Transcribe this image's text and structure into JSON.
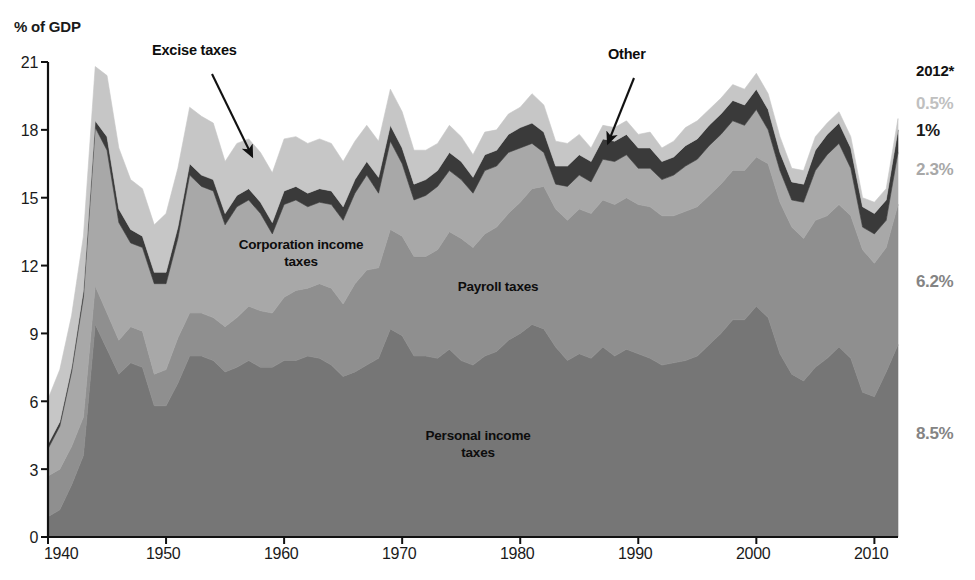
{
  "axes": {
    "y_title": "% of GDP",
    "y_ticks": [
      "21",
      "18",
      "15",
      "12",
      "9",
      "6",
      "3",
      "0"
    ],
    "y_values": [
      21,
      18,
      15,
      12,
      9,
      6,
      3,
      0
    ],
    "x_ticks": [
      "1940",
      "1950",
      "1960",
      "1970",
      "1980",
      "1990",
      "2000",
      "2010"
    ],
    "x_values": [
      1940,
      1950,
      1960,
      1970,
      1980,
      1990,
      2000,
      2010
    ]
  },
  "series_labels": {
    "personal": "Personal income\ntaxes",
    "payroll": "Payroll taxes",
    "corporate": "Corporation income\ntaxes",
    "excise": "Excise taxes",
    "other": "Other"
  },
  "end_labels": {
    "year": "2012*",
    "excise": "0.5%",
    "other": "1%",
    "corporate": "2.3%",
    "payroll": "6.2%",
    "personal": "8.5%"
  },
  "colors": {
    "personal": "#767676",
    "payroll": "#8f8f8f",
    "corporate": "#a8a8a8",
    "other": "#3a3a3a",
    "excise": "#c6c6c6",
    "axis": "#111111",
    "text": "#111111",
    "label_excise": "#c0c0c0",
    "label_other": "#1a1a1a",
    "label_corporate": "#a8a8a8",
    "label_payroll": "#808080",
    "label_personal": "#808080"
  },
  "chart_data": {
    "type": "area",
    "title": "",
    "subtitle": "",
    "xlabel": "",
    "ylabel": "% of GDP",
    "xlim": [
      1940,
      2012
    ],
    "ylim": [
      0,
      21
    ],
    "grid": false,
    "stacked": true,
    "legend": "in-plot annotations",
    "annotations": [
      {
        "text": "Excise taxes",
        "points_to_series": "excise",
        "arrow_from": [
          154,
          62
        ],
        "arrow_to": [
          250,
          158
        ]
      },
      {
        "text": "Other",
        "points_to_series": "other",
        "arrow_from": [
          648,
          68
        ],
        "arrow_to": [
          604,
          140
        ]
      }
    ],
    "x": [
      1940,
      1941,
      1942,
      1943,
      1944,
      1945,
      1946,
      1947,
      1948,
      1949,
      1950,
      1951,
      1952,
      1953,
      1954,
      1955,
      1956,
      1957,
      1958,
      1959,
      1960,
      1961,
      1962,
      1963,
      1964,
      1965,
      1966,
      1967,
      1968,
      1969,
      1970,
      1971,
      1972,
      1973,
      1974,
      1975,
      1976,
      1977,
      1978,
      1979,
      1980,
      1981,
      1982,
      1983,
      1984,
      1985,
      1986,
      1987,
      1988,
      1989,
      1990,
      1991,
      1992,
      1993,
      1994,
      1995,
      1996,
      1997,
      1998,
      1999,
      2000,
      2001,
      2002,
      2003,
      2004,
      2005,
      2006,
      2007,
      2008,
      2009,
      2010,
      2011,
      2012
    ],
    "series": [
      {
        "name": "Personal income taxes",
        "color": "#767676",
        "values": [
          0.9,
          1.2,
          2.3,
          3.6,
          9.4,
          8.3,
          7.2,
          7.7,
          7.5,
          5.8,
          5.8,
          6.8,
          8.0,
          8.0,
          7.8,
          7.3,
          7.5,
          7.8,
          7.5,
          7.5,
          7.8,
          7.8,
          8.0,
          7.9,
          7.6,
          7.1,
          7.3,
          7.6,
          7.9,
          9.2,
          8.9,
          8.0,
          8.0,
          7.9,
          8.3,
          7.8,
          7.6,
          8.0,
          8.2,
          8.7,
          9.0,
          9.4,
          9.2,
          8.4,
          7.8,
          8.1,
          7.9,
          8.4,
          8.0,
          8.3,
          8.1,
          7.9,
          7.6,
          7.7,
          7.8,
          8.0,
          8.5,
          9.0,
          9.6,
          9.6,
          10.2,
          9.7,
          8.1,
          7.2,
          6.9,
          7.5,
          7.9,
          8.4,
          7.9,
          6.4,
          6.2,
          7.3,
          8.5
        ]
      },
      {
        "name": "Payroll taxes",
        "color": "#8f8f8f",
        "values": [
          1.8,
          1.8,
          1.7,
          1.7,
          1.7,
          1.6,
          1.5,
          1.6,
          1.6,
          1.4,
          1.6,
          2.0,
          1.9,
          1.9,
          1.9,
          2.0,
          2.2,
          2.4,
          2.5,
          2.4,
          2.8,
          3.1,
          3.0,
          3.3,
          3.4,
          3.2,
          3.9,
          4.2,
          4.0,
          4.4,
          4.4,
          4.4,
          4.4,
          4.8,
          5.2,
          5.4,
          5.2,
          5.4,
          5.5,
          5.6,
          5.8,
          6.0,
          6.3,
          6.1,
          6.2,
          6.4,
          6.4,
          6.5,
          6.7,
          6.7,
          6.6,
          6.7,
          6.6,
          6.5,
          6.6,
          6.6,
          6.6,
          6.6,
          6.6,
          6.6,
          6.6,
          6.8,
          6.7,
          6.5,
          6.3,
          6.5,
          6.3,
          6.3,
          6.3,
          6.3,
          5.9,
          5.5,
          6.2
        ]
      },
      {
        "name": "Corporation income taxes",
        "color": "#a8a8a8",
        "values": [
          1.2,
          1.9,
          3.3,
          5.3,
          7.0,
          7.2,
          5.2,
          3.7,
          3.7,
          4.0,
          3.8,
          4.4,
          6.1,
          5.6,
          5.6,
          4.5,
          4.9,
          4.7,
          4.3,
          3.5,
          4.1,
          4.0,
          3.6,
          3.6,
          3.7,
          3.7,
          4.0,
          4.2,
          3.3,
          3.9,
          3.2,
          2.5,
          2.7,
          2.8,
          2.7,
          2.6,
          2.4,
          2.8,
          2.7,
          2.7,
          2.4,
          2.0,
          1.5,
          1.1,
          1.5,
          1.5,
          1.4,
          1.8,
          1.9,
          1.9,
          1.6,
          1.7,
          1.6,
          1.8,
          2.0,
          2.1,
          2.2,
          2.2,
          2.2,
          2.0,
          2.1,
          1.5,
          1.4,
          1.2,
          1.6,
          2.2,
          2.7,
          2.7,
          2.1,
          1.0,
          1.3,
          1.2,
          2.3
        ]
      },
      {
        "name": "Other",
        "color": "#3a3a3a",
        "values": [
          0.2,
          0.2,
          0.2,
          0.3,
          0.3,
          0.6,
          0.6,
          0.6,
          0.5,
          0.5,
          0.5,
          0.5,
          0.5,
          0.5,
          0.5,
          0.5,
          0.5,
          0.5,
          0.5,
          0.5,
          0.6,
          0.6,
          0.6,
          0.6,
          0.6,
          0.6,
          0.6,
          0.6,
          0.7,
          0.7,
          0.7,
          0.7,
          0.7,
          0.7,
          0.8,
          0.8,
          0.7,
          0.7,
          0.7,
          0.8,
          0.9,
          0.9,
          0.9,
          0.8,
          0.9,
          0.9,
          0.9,
          0.9,
          0.9,
          0.9,
          0.9,
          0.9,
          0.8,
          0.8,
          0.9,
          0.9,
          0.9,
          0.9,
          0.9,
          0.9,
          0.9,
          0.9,
          0.8,
          0.8,
          0.8,
          0.9,
          0.9,
          0.9,
          0.9,
          0.9,
          0.9,
          0.9,
          1.0
        ]
      },
      {
        "name": "Excise taxes",
        "color": "#c6c6c6",
        "values": [
          2.0,
          2.3,
          2.3,
          2.4,
          2.4,
          2.7,
          2.7,
          2.2,
          2.1,
          2.1,
          2.6,
          2.6,
          2.5,
          2.6,
          2.5,
          2.3,
          2.3,
          2.2,
          2.2,
          2.2,
          2.3,
          2.2,
          2.2,
          2.2,
          2.1,
          2.0,
          1.7,
          1.6,
          1.6,
          1.6,
          1.6,
          1.5,
          1.3,
          1.2,
          1.2,
          1.1,
          1.0,
          1.0,
          0.9,
          0.9,
          0.9,
          1.3,
          1.2,
          1.1,
          1.0,
          0.9,
          0.6,
          0.6,
          0.6,
          0.6,
          0.6,
          0.7,
          0.6,
          0.7,
          0.8,
          0.8,
          0.7,
          0.7,
          0.7,
          0.7,
          0.7,
          0.7,
          0.7,
          0.6,
          0.6,
          0.6,
          0.5,
          0.5,
          0.5,
          0.4,
          0.5,
          0.5,
          0.5
        ]
      }
    ]
  }
}
